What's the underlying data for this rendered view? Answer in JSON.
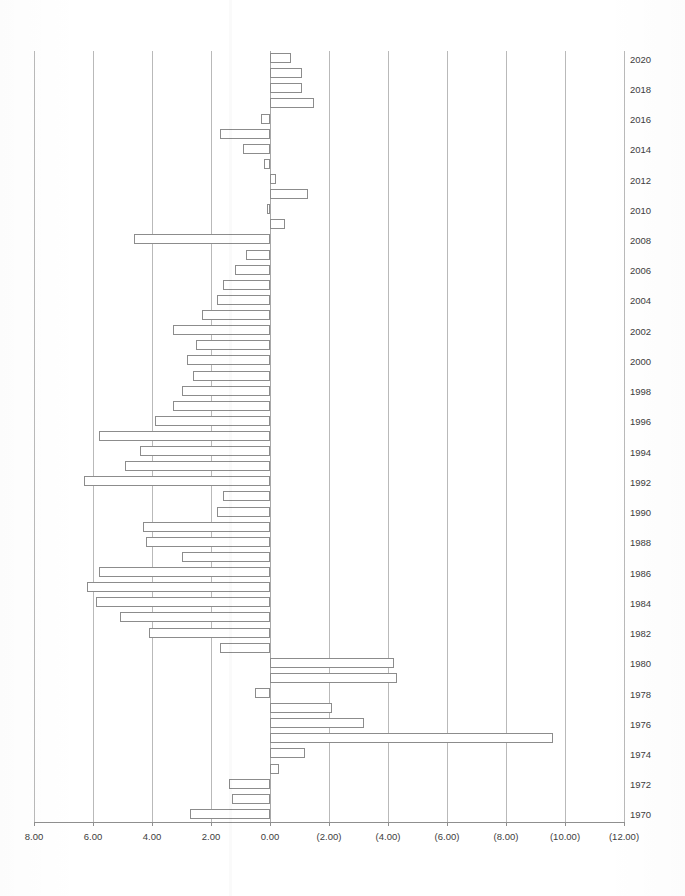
{
  "chart_data": {
    "type": "bar",
    "orientation": "horizontal",
    "title": "Real Interest Rates 1970-2020",
    "xlabel": "",
    "ylabel": "",
    "grid": true,
    "legend": null,
    "x_axis_reversed": true,
    "xlim": [
      8.0,
      -12.0
    ],
    "xticks": [
      8.0,
      6.0,
      4.0,
      2.0,
      0.0,
      -2.0,
      -4.0,
      -6.0,
      -8.0,
      -10.0,
      -12.0
    ],
    "xtick_labels": [
      "8.00",
      "6.00",
      "4.00",
      "2.00",
      "0.00",
      "(2.00)",
      "(4.00)",
      "(6.00)",
      "(8.00)",
      "(10.00)",
      "(12.00)"
    ],
    "ytick_labels": [
      "2020",
      "2018",
      "2016",
      "2014",
      "2012",
      "2010",
      "2008",
      "2006",
      "2004",
      "2002",
      "2000",
      "1998",
      "1996",
      "1994",
      "1992",
      "1990",
      "1988",
      "1986",
      "1984",
      "1982",
      "1980",
      "1978",
      "1976",
      "1974",
      "1972",
      "1970"
    ],
    "categories": [
      1970,
      1971,
      1972,
      1973,
      1974,
      1975,
      1976,
      1977,
      1978,
      1979,
      1980,
      1981,
      1982,
      1983,
      1984,
      1985,
      1986,
      1987,
      1988,
      1989,
      1990,
      1991,
      1992,
      1993,
      1994,
      1995,
      1996,
      1997,
      1998,
      1999,
      2000,
      2001,
      2002,
      2003,
      2004,
      2005,
      2006,
      2007,
      2008,
      2009,
      2010,
      2011,
      2012,
      2013,
      2014,
      2015,
      2016,
      2017,
      2018,
      2019,
      2020
    ],
    "values": [
      2.7,
      1.3,
      1.4,
      -0.3,
      -1.2,
      -9.6,
      -3.2,
      -2.1,
      0.5,
      -4.3,
      -4.2,
      1.7,
      4.1,
      5.1,
      5.9,
      6.2,
      5.8,
      3.0,
      4.2,
      4.3,
      1.8,
      1.6,
      6.3,
      4.9,
      4.4,
      5.8,
      3.9,
      3.3,
      3.0,
      2.6,
      2.8,
      2.5,
      3.3,
      2.3,
      1.8,
      1.6,
      1.2,
      0.8,
      4.6,
      -0.5,
      0.1,
      -1.3,
      -0.2,
      0.2,
      0.9,
      1.7,
      0.3,
      -1.5,
      -1.1,
      -1.1,
      -0.7
    ],
    "series_name": "Real Interest Rate (%)",
    "bar_style": {
      "fill": "#ffffff",
      "edge": "#8c8c8c"
    },
    "note": "Positive values extend to the left; negative values (shown in parentheses on axis) extend to the right."
  }
}
